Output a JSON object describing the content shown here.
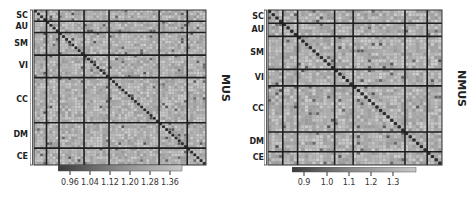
{
  "chart_data": [
    {
      "type": "heatmap",
      "title": "MUS",
      "side_label": "MUS",
      "row_groups": [
        "SC",
        "AU",
        "SM",
        "VI",
        "CC",
        "DM",
        "CE"
      ],
      "col_groups": [
        "SC",
        "AU",
        "SM",
        "VI",
        "CC",
        "DM",
        "CE"
      ],
      "group_sizes": [
        4,
        4,
        8,
        8,
        16,
        9,
        6
      ],
      "colorbar": {
        "ticks": [
          0.96,
          1.04,
          1.12,
          1.2,
          1.28,
          1.36
        ],
        "tick_labels": [
          "0.96",
          "1.04",
          "1.12",
          "1.20",
          "1.28",
          "1.36"
        ],
        "range": [
          0.9,
          1.38
        ],
        "colormap": "gray"
      },
      "notes": "Dark diagonal indicates high values along diagonal; dark lines separate functional groups"
    },
    {
      "type": "heatmap",
      "title": "NMUS",
      "side_label": "NMUS",
      "row_groups": [
        "SC",
        "AU",
        "SM",
        "VI",
        "CC",
        "DM",
        "CE"
      ],
      "col_groups": [
        "SC",
        "AU",
        "SM",
        "VI",
        "CC",
        "DM",
        "CE"
      ],
      "group_sizes": [
        4,
        4,
        10,
        5,
        14,
        6,
        4
      ],
      "colorbar": {
        "ticks": [
          0.9,
          1.0,
          1.1,
          1.2,
          1.3
        ],
        "tick_labels": [
          "0.9",
          "1.0",
          "1.1",
          "1.2",
          "1.3"
        ],
        "range": [
          0.85,
          1.38
        ],
        "colormap": "gray"
      },
      "notes": "Dark diagonal indicates high values along diagonal; dark lines separate functional groups"
    }
  ],
  "panels": [
    {
      "side_label": "MUS",
      "labels": [
        "SC",
        "AU",
        "SM",
        "VI",
        "CC",
        "DM",
        "CE"
      ],
      "ticks": [
        "0.96",
        "1.04",
        "1.12",
        "1.20",
        "1.28",
        "1.36"
      ]
    },
    {
      "side_label": "NMUS",
      "labels": [
        "SC",
        "AU",
        "SM",
        "VI",
        "CC",
        "DM",
        "CE"
      ],
      "ticks": [
        "0.9",
        "1.0",
        "1.1",
        "1.2",
        "1.3"
      ]
    }
  ]
}
